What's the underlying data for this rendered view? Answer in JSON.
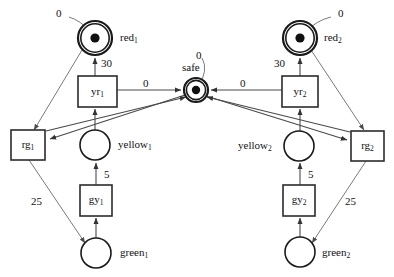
{
  "diagram": {
    "type": "petri-net",
    "colors": {
      "stroke": "#1a1a1a",
      "arc": "#4a4a4a",
      "token": "#101010",
      "background": "#ffffff"
    },
    "places": [
      {
        "id": "red1",
        "label": "red",
        "sub": "1",
        "cx": 95,
        "cy": 38,
        "r": 17,
        "tokens": 1,
        "double": true,
        "label_pos": "right",
        "marking_label": "0",
        "marking_x": 56,
        "marking_y": 8
      },
      {
        "id": "red2",
        "label": "red",
        "sub": "2",
        "cx": 300,
        "cy": 38,
        "r": 17,
        "tokens": 1,
        "double": true,
        "label_pos": "right",
        "marking_label": "0",
        "marking_x": 338,
        "marking_y": 8
      },
      {
        "id": "safe",
        "label": "safe",
        "sub": "",
        "cx": 196,
        "cy": 90,
        "r": 12,
        "tokens": 1,
        "double": true,
        "label_pos": "top",
        "marking_label": "0",
        "marking_x": 186,
        "marking_y": 54
      },
      {
        "id": "yellow1",
        "label": "yellow",
        "sub": "1",
        "cx": 95,
        "cy": 145,
        "r": 15,
        "tokens": 0,
        "double": false,
        "label_pos": "right",
        "marking_label": "",
        "marking_x": 0,
        "marking_y": 0
      },
      {
        "id": "yellow2",
        "label": "yellow",
        "sub": "2",
        "cx": 299,
        "cy": 146,
        "r": 15,
        "tokens": 0,
        "double": false,
        "label_pos": "left",
        "marking_label": "",
        "marking_x": 0,
        "marking_y": 0
      },
      {
        "id": "green1",
        "label": "green",
        "sub": "1",
        "cx": 96,
        "cy": 253,
        "r": 15,
        "tokens": 0,
        "double": false,
        "label_pos": "right",
        "marking_label": "",
        "marking_x": 0,
        "marking_y": 0
      },
      {
        "id": "green2",
        "label": "green",
        "sub": "2",
        "cx": 300,
        "cy": 252,
        "r": 15,
        "tokens": 0,
        "double": false,
        "label_pos": "right",
        "marking_label": "",
        "marking_x": 0,
        "marking_y": 0
      }
    ],
    "transitions": [
      {
        "id": "yr1",
        "label": "yr",
        "sub": "1",
        "x": 78,
        "y": 76,
        "w": 39,
        "h": 31
      },
      {
        "id": "yr2",
        "label": "yr",
        "sub": "2",
        "x": 282,
        "y": 76,
        "w": 36,
        "h": 31
      },
      {
        "id": "rg1",
        "label": "rg",
        "sub": "1",
        "x": 11,
        "y": 130,
        "w": 34,
        "h": 30
      },
      {
        "id": "rg2",
        "label": "rg",
        "sub": "2",
        "x": 351,
        "y": 131,
        "w": 33,
        "h": 30
      },
      {
        "id": "gy1",
        "label": "gy",
        "sub": "1",
        "x": 80,
        "y": 185,
        "w": 32,
        "h": 31
      },
      {
        "id": "gy2",
        "label": "gy",
        "sub": "2",
        "x": 283,
        "y": 185,
        "w": 32,
        "h": 31
      }
    ],
    "arc_weights": [
      {
        "id": "w-yr1-red1",
        "text": "30",
        "x": 101,
        "y": 58
      },
      {
        "id": "w-yr2-red2",
        "text": "30",
        "x": 274,
        "y": 58
      },
      {
        "id": "w-yr1-safe",
        "text": "0",
        "x": 143,
        "y": 78
      },
      {
        "id": "w-yr2-safe",
        "text": "0",
        "x": 240,
        "y": 78
      },
      {
        "id": "w-gy1-yellow1",
        "text": "5",
        "x": 104,
        "y": 169
      },
      {
        "id": "w-gy2-yellow2",
        "text": "5",
        "x": 308,
        "y": 169
      },
      {
        "id": "w-rg1-green1",
        "text": "25",
        "x": 31,
        "y": 196
      },
      {
        "id": "w-rg2-green2",
        "text": "25",
        "x": 345,
        "y": 196
      }
    ],
    "arcs": [
      {
        "id": "arc-yr1-red1",
        "from": "yr1",
        "to": "red1",
        "weight": "30"
      },
      {
        "id": "arc-yellow1-yr1",
        "from": "yellow1",
        "to": "yr1",
        "weight": ""
      },
      {
        "id": "arc-yr1-safe",
        "from": "yr1",
        "to": "safe",
        "weight": "0"
      },
      {
        "id": "arc-red1-rg1",
        "from": "red1",
        "to": "rg1",
        "weight": ""
      },
      {
        "id": "arc-safe-rg1",
        "from": "safe",
        "to": "rg1",
        "weight": ""
      },
      {
        "id": "arc-rg1-green1",
        "from": "rg1",
        "to": "green1",
        "weight": "25"
      },
      {
        "id": "arc-green1-gy1",
        "from": "green1",
        "to": "gy1",
        "weight": ""
      },
      {
        "id": "arc-gy1-yellow1",
        "from": "gy1",
        "to": "yellow1",
        "weight": "5"
      },
      {
        "id": "arc-rg1-safe",
        "from": "rg1",
        "to": "safe",
        "weight": ""
      },
      {
        "id": "arc-yr2-red2",
        "from": "yr2",
        "to": "red2",
        "weight": "30"
      },
      {
        "id": "arc-yellow2-yr2",
        "from": "yellow2",
        "to": "yr2",
        "weight": ""
      },
      {
        "id": "arc-yr2-safe",
        "from": "yr2",
        "to": "safe",
        "weight": "0"
      },
      {
        "id": "arc-red2-rg2",
        "from": "red2",
        "to": "rg2",
        "weight": ""
      },
      {
        "id": "arc-safe-rg2",
        "from": "safe",
        "to": "rg2",
        "weight": ""
      },
      {
        "id": "arc-rg2-green2",
        "from": "rg2",
        "to": "green2",
        "weight": "25"
      },
      {
        "id": "arc-green2-gy2",
        "from": "green2",
        "to": "gy2",
        "weight": ""
      },
      {
        "id": "arc-gy2-yellow2",
        "from": "gy2",
        "to": "yellow2",
        "weight": "5"
      },
      {
        "id": "arc-rg2-safe",
        "from": "rg2",
        "to": "safe",
        "weight": ""
      }
    ]
  }
}
